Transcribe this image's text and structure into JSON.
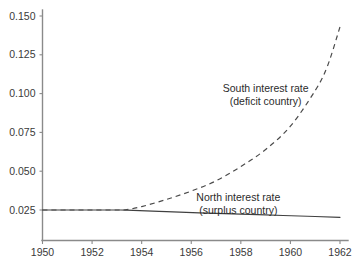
{
  "chart_data": {
    "type": "line",
    "title": "",
    "xlabel": "",
    "ylabel": "",
    "xlim": [
      1950,
      1962
    ],
    "ylim": [
      0.0,
      0.155
    ],
    "grid": false,
    "legend_position": "inline-annotations",
    "x_ticks": [
      "1950",
      "1952",
      "1954",
      "1956",
      "1958",
      "1960",
      "1962"
    ],
    "y_ticks": [
      "0.025",
      "0.050",
      "0.075",
      "0.100",
      "0.125",
      "0.150"
    ],
    "y_tick_values": [
      0.025,
      0.05,
      0.075,
      0.1,
      0.125,
      0.15
    ],
    "x_tick_values": [
      1950,
      1952,
      1954,
      1956,
      1958,
      1960,
      1962
    ],
    "series": [
      {
        "name": "South interest rate (deficit country)",
        "annotation_line1": "South interest rate",
        "annotation_line2": "(deficit country)",
        "style": "dashed",
        "color": "#4a4a4a",
        "x": [
          1950,
          1951,
          1952,
          1953,
          1953.4,
          1954,
          1955,
          1956,
          1957,
          1958,
          1959,
          1960,
          1961,
          1961.5,
          1962
        ],
        "values": [
          0.025,
          0.025,
          0.025,
          0.025,
          0.0252,
          0.0272,
          0.0318,
          0.0372,
          0.0438,
          0.053,
          0.064,
          0.079,
          0.102,
          0.118,
          0.143
        ]
      },
      {
        "name": "North interest rate (surplus country)",
        "annotation_line1": "North interest rate",
        "annotation_line2": "(surplus country)",
        "style": "solid",
        "color": "#404040",
        "x": [
          1950,
          1951,
          1952,
          1953,
          1953.4,
          1955,
          1957,
          1959,
          1961,
          1962
        ],
        "values": [
          0.025,
          0.025,
          0.025,
          0.025,
          0.0249,
          0.0239,
          0.0228,
          0.0218,
          0.0208,
          0.0203
        ]
      }
    ],
    "annotations": [
      {
        "id": "south-label",
        "text_line1": "South interest rate",
        "text_line2": "(deficit country)",
        "x": 1959.0,
        "y": 0.101
      },
      {
        "id": "north-label",
        "text_line1": "North interest rate",
        "text_line2": "(surplus country)",
        "x": 1957.9,
        "y": 0.0305
      }
    ],
    "colors": {
      "background": "#ffffff",
      "axis": "#8a8a8a",
      "text": "#2b2b2b",
      "south_series": "#4a4a4a",
      "north_series": "#404040"
    }
  }
}
